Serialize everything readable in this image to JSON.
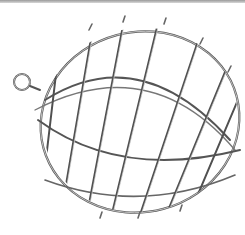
{
  "image": {
    "subject": "wire cage ball with hanging ring",
    "background_color": "#ffffff",
    "wire_color": "#6e6e6e",
    "highlight_color": "#d0d0d0"
  }
}
